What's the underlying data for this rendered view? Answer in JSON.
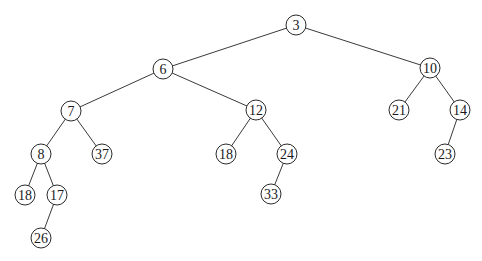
{
  "diagram": {
    "type": "binary-tree",
    "node_radius": 10,
    "nodes": [
      {
        "id": "n3",
        "label": "3",
        "x": 296,
        "y": 25
      },
      {
        "id": "n6",
        "label": "6",
        "x": 163,
        "y": 69
      },
      {
        "id": "n10",
        "label": "10",
        "x": 430,
        "y": 68
      },
      {
        "id": "n7",
        "label": "7",
        "x": 71,
        "y": 111
      },
      {
        "id": "n12",
        "label": "12",
        "x": 256,
        "y": 110
      },
      {
        "id": "n21",
        "label": "21",
        "x": 399,
        "y": 110
      },
      {
        "id": "n14",
        "label": "14",
        "x": 460,
        "y": 110
      },
      {
        "id": "n8",
        "label": "8",
        "x": 41,
        "y": 154
      },
      {
        "id": "n37",
        "label": "37",
        "x": 102,
        "y": 154
      },
      {
        "id": "n18b",
        "label": "18",
        "x": 226,
        "y": 154
      },
      {
        "id": "n24",
        "label": "24",
        "x": 287,
        "y": 154
      },
      {
        "id": "n23",
        "label": "23",
        "x": 445,
        "y": 154
      },
      {
        "id": "n18a",
        "label": "18",
        "x": 25,
        "y": 195
      },
      {
        "id": "n17",
        "label": "17",
        "x": 57,
        "y": 195
      },
      {
        "id": "n33",
        "label": "33",
        "x": 271,
        "y": 194
      },
      {
        "id": "n26",
        "label": "26",
        "x": 41,
        "y": 238
      }
    ],
    "edges": [
      {
        "from": "n3",
        "to": "n6"
      },
      {
        "from": "n3",
        "to": "n10"
      },
      {
        "from": "n6",
        "to": "n7"
      },
      {
        "from": "n6",
        "to": "n12"
      },
      {
        "from": "n10",
        "to": "n21"
      },
      {
        "from": "n10",
        "to": "n14"
      },
      {
        "from": "n7",
        "to": "n8"
      },
      {
        "from": "n7",
        "to": "n37"
      },
      {
        "from": "n12",
        "to": "n18b"
      },
      {
        "from": "n12",
        "to": "n24"
      },
      {
        "from": "n14",
        "to": "n23"
      },
      {
        "from": "n8",
        "to": "n18a"
      },
      {
        "from": "n8",
        "to": "n17"
      },
      {
        "from": "n24",
        "to": "n33"
      },
      {
        "from": "n17",
        "to": "n26"
      }
    ]
  }
}
